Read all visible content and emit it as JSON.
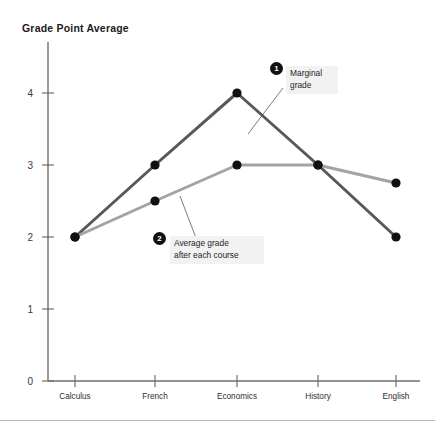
{
  "chart_data": {
    "type": "line",
    "title": "Grade Point Average",
    "xlabel": "",
    "ylabel": "Grade Point Average",
    "categories": [
      "Calculus",
      "French",
      "Economics",
      "History",
      "English"
    ],
    "ylim": [
      0,
      4.6
    ],
    "yticks": [
      "0",
      "1",
      "2",
      "3",
      "4"
    ],
    "grid": false,
    "legend": "annotations",
    "series": [
      {
        "name": "Marginal grade",
        "color": "#585858",
        "values": [
          2,
          3,
          4,
          3,
          2
        ]
      },
      {
        "name": "Average grade after each course",
        "color": "#a3a3a3",
        "values": [
          2,
          2.5,
          3,
          3,
          2.75
        ]
      }
    ],
    "annotations": [
      {
        "number": "1",
        "text": "Marginal\ngrade",
        "target_series": "Marginal grade"
      },
      {
        "number": "2",
        "text": "Average grade\nafter each course",
        "target_series": "Average grade after each course"
      }
    ]
  }
}
